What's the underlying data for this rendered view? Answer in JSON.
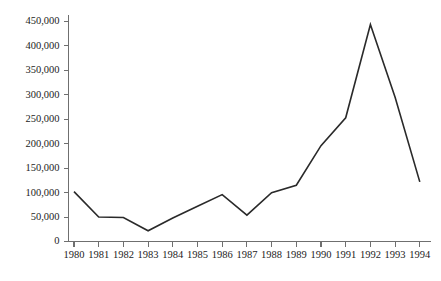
{
  "chart_data": {
    "type": "line",
    "title": "",
    "subtitle": "",
    "xlabel": "",
    "ylabel": "",
    "categories": [
      "1980",
      "1981",
      "1982",
      "1983",
      "1984",
      "1985",
      "1986",
      "1987",
      "1988",
      "1989",
      "1990",
      "1991",
      "1992",
      "1993",
      "1994"
    ],
    "values": [
      102000,
      50000,
      49000,
      22000,
      48000,
      72000,
      96000,
      54000,
      100000,
      115000,
      196000,
      253000,
      444000,
      295000,
      122000
    ],
    "series": [
      {
        "name": "",
        "values": [
          102000,
          50000,
          49000,
          22000,
          48000,
          72000,
          96000,
          54000,
          100000,
          115000,
          196000,
          253000,
          444000,
          295000,
          122000
        ]
      }
    ],
    "ylim": [
      0,
      450000
    ],
    "ytick_values": [
      0,
      50000,
      100000,
      150000,
      200000,
      250000,
      300000,
      350000,
      400000,
      450000
    ],
    "ytick_labels": [
      "0",
      "50,000",
      "100,000",
      "150,000",
      "200,000",
      "250,000",
      "300,000",
      "350,000",
      "400,000",
      "450,000"
    ],
    "xtick_labels": [
      "1980",
      "1981",
      "1982",
      "1983",
      "1984",
      "1985",
      "1986",
      "1987",
      "1988",
      "1989",
      "1990",
      "1991",
      "1992",
      "1993",
      "1994"
    ],
    "grid": false,
    "legend": "none",
    "line_color": "#2a2a2a",
    "axis_color": "#6f6f6f",
    "background_color": "#ffffff"
  }
}
